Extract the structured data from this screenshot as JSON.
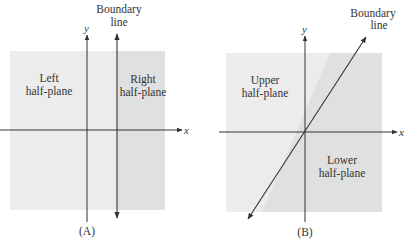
{
  "colors": {
    "light_region": "#ececec",
    "dark_region": "#e0e0e0",
    "line": "#333333"
  },
  "panel_a": {
    "caption": "(A)",
    "x_axis_label": "x",
    "y_axis_label": "y",
    "boundary_label_line1": "Boundary",
    "boundary_label_line2": "line",
    "left_region_line1": "Left",
    "left_region_line2": "half-plane",
    "right_region_line1": "Right",
    "right_region_line2": "half-plane",
    "boundary_orientation": "vertical"
  },
  "panel_b": {
    "caption": "(B)",
    "x_axis_label": "x",
    "y_axis_label": "y",
    "boundary_label_line1": "Boundary",
    "boundary_label_line2": "line",
    "upper_region_line1": "Upper",
    "upper_region_line2": "half-plane",
    "lower_region_line1": "Lower",
    "lower_region_line2": "half-plane",
    "boundary_orientation": "diagonal through origin"
  }
}
